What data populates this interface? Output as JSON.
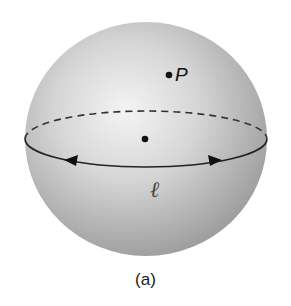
{
  "figure": {
    "caption": "(a)",
    "sphere": {
      "cx": 146,
      "cy": 139,
      "rx": 121,
      "ry": 117,
      "highlight_color": "#f2f2f2",
      "shade_color": "#9a9a9a"
    },
    "equator": {
      "cx": 146,
      "cy": 139,
      "rx": 121,
      "ry": 28,
      "back_style": "dashed",
      "front_style": "solid",
      "label": "ℓ"
    },
    "points": [
      {
        "name": "P",
        "label": "P",
        "x": 169,
        "y": 75
      },
      {
        "name": "center",
        "label": "",
        "x": 145,
        "y": 139
      }
    ],
    "arrows": [
      {
        "direction": "left",
        "x": 73,
        "y": 162
      },
      {
        "direction": "right",
        "x": 212,
        "y": 162
      }
    ]
  }
}
